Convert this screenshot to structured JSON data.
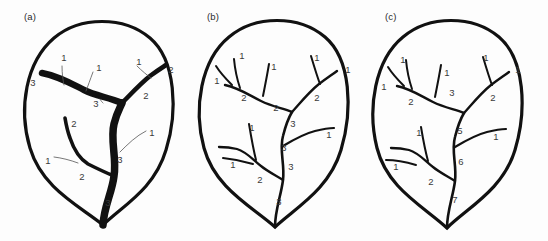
{
  "figure": {
    "background_color": "#fdfdfd",
    "ink_color": "#111111",
    "label_color": "#3a3a3a",
    "leader_color": "#555555",
    "panel_count": 3
  },
  "panels": [
    {
      "id": "a",
      "caption": "(a)",
      "ordering_scheme": "descending-order thick-to-thin (midrib order 3)",
      "midrib_order": "3",
      "stroke_style": "variable-width: higher order veins drawn thicker",
      "labels": [
        {
          "text": "3",
          "x": 33,
          "y": 83
        },
        {
          "text": "1",
          "x": 64,
          "y": 58
        },
        {
          "text": "1",
          "x": 99,
          "y": 68
        },
        {
          "text": "1",
          "x": 139,
          "y": 62
        },
        {
          "text": "2",
          "x": 171,
          "y": 70
        },
        {
          "text": "2",
          "x": 146,
          "y": 96
        },
        {
          "text": "3",
          "x": 96,
          "y": 104
        },
        {
          "text": "2",
          "x": 74,
          "y": 124
        },
        {
          "text": "1",
          "x": 152,
          "y": 133
        },
        {
          "text": "1",
          "x": 48,
          "y": 161
        },
        {
          "text": "3",
          "x": 120,
          "y": 160
        },
        {
          "text": "2",
          "x": 82,
          "y": 177
        },
        {
          "text": "3",
          "x": 108,
          "y": 203
        }
      ]
    },
    {
      "id": "b",
      "caption": "(b)",
      "ordering_scheme": "uniform thin lines, Strahler-style ordering",
      "midrib_order": "3",
      "stroke_style": "uniform thin stroke for all veins",
      "labels": [
        {
          "text": "1",
          "x": 59,
          "y": 56
        },
        {
          "text": "1",
          "x": 34,
          "y": 81
        },
        {
          "text": "1",
          "x": 91,
          "y": 67
        },
        {
          "text": "1",
          "x": 134,
          "y": 58
        },
        {
          "text": "1",
          "x": 165,
          "y": 70
        },
        {
          "text": "2",
          "x": 61,
          "y": 98
        },
        {
          "text": "2",
          "x": 93,
          "y": 108
        },
        {
          "text": "2",
          "x": 134,
          "y": 98
        },
        {
          "text": "3",
          "x": 110,
          "y": 124
        },
        {
          "text": "1",
          "x": 69,
          "y": 128
        },
        {
          "text": "1",
          "x": 146,
          "y": 135
        },
        {
          "text": "3",
          "x": 101,
          "y": 148
        },
        {
          "text": "1",
          "x": 50,
          "y": 165
        },
        {
          "text": "3",
          "x": 108,
          "y": 167
        },
        {
          "text": "2",
          "x": 77,
          "y": 180
        },
        {
          "text": "3",
          "x": 96,
          "y": 202
        }
      ]
    },
    {
      "id": "c",
      "caption": "(c)",
      "ordering_scheme": "additive / summed branching order along midrib",
      "midrib_order": "7",
      "stroke_style": "uniform thin stroke for all veins",
      "labels": [
        {
          "text": "1",
          "x": 38,
          "y": 60
        },
        {
          "text": "1",
          "x": 19,
          "y": 87
        },
        {
          "text": "1",
          "x": 82,
          "y": 73
        },
        {
          "text": "1",
          "x": 121,
          "y": 58
        },
        {
          "text": "1",
          "x": 153,
          "y": 70
        },
        {
          "text": "2",
          "x": 46,
          "y": 102
        },
        {
          "text": "3",
          "x": 87,
          "y": 93
        },
        {
          "text": "2",
          "x": 128,
          "y": 98
        },
        {
          "text": "5",
          "x": 95,
          "y": 131
        },
        {
          "text": "1",
          "x": 131,
          "y": 137
        },
        {
          "text": "1",
          "x": 54,
          "y": 133
        },
        {
          "text": "6",
          "x": 96,
          "y": 162
        },
        {
          "text": "1",
          "x": 31,
          "y": 167
        },
        {
          "text": "2",
          "x": 66,
          "y": 182
        },
        {
          "text": "7",
          "x": 90,
          "y": 200
        }
      ]
    }
  ]
}
